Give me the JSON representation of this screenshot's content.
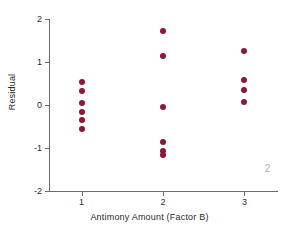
{
  "chart_data": {
    "type": "scatter",
    "title": "",
    "xlabel": "Antimony Amount (Factor B)",
    "ylabel": "Residual",
    "xlim": [
      0.6,
      3.4
    ],
    "ylim": [
      -2,
      2
    ],
    "xticks": [
      1,
      2,
      3
    ],
    "xtick_labels": [
      "1",
      "2",
      "3"
    ],
    "yticks": [
      2,
      1,
      0,
      -1,
      -2
    ],
    "ytick_labels": [
      "2",
      "1",
      "0",
      "-1",
      "-2"
    ],
    "grid": false,
    "legend": null,
    "marker_color": "#8c1838",
    "axis_color": "#6b6b6b",
    "points": [
      {
        "x": 1,
        "y": 0.53
      },
      {
        "x": 1,
        "y": 0.33
      },
      {
        "x": 1,
        "y": 0.04
      },
      {
        "x": 1,
        "y": -0.16
      },
      {
        "x": 1,
        "y": -0.36
      },
      {
        "x": 1,
        "y": -0.55
      },
      {
        "x": 2,
        "y": 1.73
      },
      {
        "x": 2,
        "y": 1.15
      },
      {
        "x": 2,
        "y": -0.05
      },
      {
        "x": 2,
        "y": -0.85
      },
      {
        "x": 2,
        "y": -1.08
      },
      {
        "x": 2,
        "y": -1.16
      },
      {
        "x": 3,
        "y": 1.26
      },
      {
        "x": 3,
        "y": 0.58
      },
      {
        "x": 3,
        "y": 0.35
      },
      {
        "x": 3,
        "y": 0.08
      }
    ],
    "annotations": [
      {
        "text": "2",
        "x": 3.25,
        "y": -1.35,
        "color": "#b9a9ae"
      }
    ]
  }
}
